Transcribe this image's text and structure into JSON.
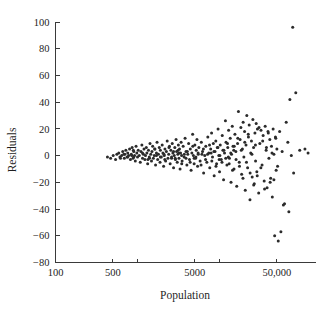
{
  "chart_data": {
    "type": "scatter",
    "title": "",
    "xlabel": "Population",
    "ylabel": "Residuals",
    "xscale": "log",
    "yscale": "linear",
    "grid": false,
    "legend": null,
    "xlim": [
      100,
      150000
    ],
    "ylim": [
      -80,
      100
    ],
    "xticks": [
      100,
      500,
      1000,
      5000,
      10000,
      50000
    ],
    "xtick_labels": [
      "100",
      "500",
      "",
      "5000",
      "",
      "50,000"
    ],
    "yticks": [
      100,
      80,
      60,
      40,
      20,
      0,
      -20,
      -40,
      -60,
      -80
    ],
    "ytick_labels": [
      "100",
      "80",
      "60",
      "40",
      "20",
      "0",
      "−20",
      "−40",
      "−60",
      "−80"
    ],
    "marker": "dot",
    "marker_color": "#2b2b2b",
    "marker_size": 1.5,
    "n_points": 281,
    "points": [
      [
        430,
        -1
      ],
      [
        470,
        -2
      ],
      [
        505,
        0
      ],
      [
        540,
        -3
      ],
      [
        560,
        1
      ],
      [
        590,
        2
      ],
      [
        610,
        -1
      ],
      [
        640,
        0
      ],
      [
        660,
        3
      ],
      [
        690,
        -2
      ],
      [
        700,
        1
      ],
      [
        720,
        4
      ],
      [
        745,
        -1
      ],
      [
        760,
        2
      ],
      [
        780,
        0
      ],
      [
        800,
        5
      ],
      [
        820,
        -3
      ],
      [
        840,
        1
      ],
      [
        860,
        6
      ],
      [
        880,
        -2
      ],
      [
        900,
        3
      ],
      [
        920,
        0
      ],
      [
        940,
        -4
      ],
      [
        960,
        7
      ],
      [
        980,
        2
      ],
      [
        1000,
        -1
      ],
      [
        1020,
        4
      ],
      [
        1050,
        0
      ],
      [
        1080,
        -5
      ],
      [
        1100,
        3
      ],
      [
        1130,
        8
      ],
      [
        1150,
        -2
      ],
      [
        1180,
        1
      ],
      [
        1200,
        5
      ],
      [
        1230,
        -3
      ],
      [
        1250,
        0
      ],
      [
        1280,
        6
      ],
      [
        1300,
        2
      ],
      [
        1330,
        -6
      ],
      [
        1360,
        4
      ],
      [
        1390,
        -1
      ],
      [
        1420,
        9
      ],
      [
        1450,
        1
      ],
      [
        1480,
        -4
      ],
      [
        1500,
        3
      ],
      [
        1530,
        7
      ],
      [
        1560,
        -2
      ],
      [
        1600,
        0
      ],
      [
        1630,
        5
      ],
      [
        1660,
        -7
      ],
      [
        1700,
        2
      ],
      [
        1730,
        10
      ],
      [
        1760,
        -3
      ],
      [
        1800,
        1
      ],
      [
        1840,
        6
      ],
      [
        1880,
        -5
      ],
      [
        1900,
        4
      ],
      [
        1950,
        -1
      ],
      [
        2000,
        8
      ],
      [
        2040,
        2
      ],
      [
        2080,
        -8
      ],
      [
        2120,
        0
      ],
      [
        2160,
        5
      ],
      [
        2200,
        -4
      ],
      [
        2250,
        3
      ],
      [
        2300,
        11
      ],
      [
        2350,
        -2
      ],
      [
        2400,
        1
      ],
      [
        2450,
        7
      ],
      [
        2500,
        -6
      ],
      [
        2550,
        4
      ],
      [
        2600,
        -1
      ],
      [
        2650,
        9
      ],
      [
        2700,
        2
      ],
      [
        2750,
        -9
      ],
      [
        2800,
        0
      ],
      [
        2850,
        6
      ],
      [
        2900,
        -3
      ],
      [
        2950,
        12
      ],
      [
        3000,
        3
      ],
      [
        3050,
        -5
      ],
      [
        3100,
        1
      ],
      [
        3150,
        8
      ],
      [
        3200,
        -2
      ],
      [
        3250,
        5
      ],
      [
        3300,
        -10
      ],
      [
        3350,
        2
      ],
      [
        3400,
        10
      ],
      [
        3450,
        0
      ],
      [
        3500,
        -4
      ],
      [
        3600,
        7
      ],
      [
        3700,
        -1
      ],
      [
        3800,
        13
      ],
      [
        3900,
        3
      ],
      [
        4000,
        -7
      ],
      [
        4100,
        1
      ],
      [
        4200,
        9
      ],
      [
        4300,
        -3
      ],
      [
        4400,
        5
      ],
      [
        4500,
        -11
      ],
      [
        4600,
        2
      ],
      [
        4700,
        16
      ],
      [
        4800,
        0
      ],
      [
        4900,
        -6
      ],
      [
        5000,
        8
      ],
      [
        5100,
        -2
      ],
      [
        5200,
        4
      ],
      [
        5300,
        12
      ],
      [
        5400,
        -8
      ],
      [
        5500,
        1
      ],
      [
        5600,
        6
      ],
      [
        5800,
        -4
      ],
      [
        6000,
        10
      ],
      [
        6200,
        3
      ],
      [
        6400,
        -13
      ],
      [
        6600,
        0
      ],
      [
        6800,
        7
      ],
      [
        7000,
        -5
      ],
      [
        7200,
        14
      ],
      [
        7400,
        2
      ],
      [
        7600,
        -9
      ],
      [
        7800,
        5
      ],
      [
        8000,
        17
      ],
      [
        8200,
        -1
      ],
      [
        8400,
        9
      ],
      [
        8600,
        -15
      ],
      [
        8800,
        3
      ],
      [
        9000,
        11
      ],
      [
        9200,
        -6
      ],
      [
        9400,
        6
      ],
      [
        9600,
        20
      ],
      [
        9800,
        0
      ],
      [
        10000,
        -12
      ],
      [
        10200,
        8
      ],
      [
        10500,
        -3
      ],
      [
        10800,
        15
      ],
      [
        11000,
        4
      ],
      [
        11200,
        -18
      ],
      [
        11500,
        2
      ],
      [
        11800,
        26
      ],
      [
        12000,
        10
      ],
      [
        12300,
        -7
      ],
      [
        12600,
        6
      ],
      [
        12900,
        19
      ],
      [
        13200,
        -2
      ],
      [
        13500,
        13
      ],
      [
        13800,
        -20
      ],
      [
        14000,
        1
      ],
      [
        14300,
        22
      ],
      [
        14600,
        7
      ],
      [
        15000,
        -10
      ],
      [
        15400,
        16
      ],
      [
        15800,
        3
      ],
      [
        16200,
        -23
      ],
      [
        16600,
        9
      ],
      [
        17000,
        33
      ],
      [
        17400,
        -5
      ],
      [
        17800,
        12
      ],
      [
        18200,
        21
      ],
      [
        18600,
        -14
      ],
      [
        19000,
        5
      ],
      [
        19400,
        25
      ],
      [
        19800,
        -1
      ],
      [
        20200,
        18
      ],
      [
        20600,
        -26
      ],
      [
        21000,
        8
      ],
      [
        21500,
        30
      ],
      [
        22000,
        -9
      ],
      [
        22500,
        14
      ],
      [
        23000,
        23
      ],
      [
        23500,
        -33
      ],
      [
        24000,
        2
      ],
      [
        24500,
        11
      ],
      [
        25000,
        -16
      ],
      [
        25500,
        27
      ],
      [
        26000,
        6
      ],
      [
        26500,
        -21
      ],
      [
        27000,
        17
      ],
      [
        27500,
        -4
      ],
      [
        28000,
        24
      ],
      [
        28500,
        -12
      ],
      [
        29000,
        20
      ],
      [
        30000,
        -28
      ],
      [
        31000,
        9
      ],
      [
        32000,
        19
      ],
      [
        33000,
        -7
      ],
      [
        34000,
        15
      ],
      [
        35000,
        -19
      ],
      [
        36000,
        22
      ],
      [
        37000,
        4
      ],
      [
        38000,
        -24
      ],
      [
        39000,
        18
      ],
      [
        40000,
        -2
      ],
      [
        41000,
        12
      ],
      [
        42000,
        -17
      ],
      [
        43000,
        7
      ],
      [
        44000,
        -31
      ],
      [
        45000,
        20
      ],
      [
        46000,
        1
      ],
      [
        47000,
        -60
      ],
      [
        48000,
        14
      ],
      [
        49000,
        -11
      ],
      [
        50000,
        5
      ],
      [
        52000,
        -64
      ],
      [
        54000,
        18
      ],
      [
        56000,
        -57
      ],
      [
        58000,
        3
      ],
      [
        60000,
        -37
      ],
      [
        62000,
        -36
      ],
      [
        65000,
        25
      ],
      [
        68000,
        10
      ],
      [
        70000,
        -42
      ],
      [
        72000,
        42
      ],
      [
        75000,
        0
      ],
      [
        78000,
        96
      ],
      [
        80000,
        -13
      ],
      [
        85000,
        47
      ],
      [
        95000,
        4
      ],
      [
        110000,
        5
      ],
      [
        120000,
        2
      ],
      [
        2150,
        -3
      ],
      [
        2420,
        6
      ],
      [
        2880,
        -2
      ],
      [
        3120,
        4
      ],
      [
        3460,
        -6
      ],
      [
        3720,
        1
      ],
      [
        4050,
        3
      ],
      [
        4380,
        -5
      ],
      [
        4720,
        7
      ],
      [
        5150,
        -1
      ],
      [
        5480,
        2
      ],
      [
        5950,
        -7
      ],
      [
        6350,
        5
      ],
      [
        6750,
        -3
      ],
      [
        7150,
        1
      ],
      [
        7550,
        8
      ],
      [
        8050,
        -4
      ],
      [
        8550,
        3
      ],
      [
        9050,
        -8
      ],
      [
        9550,
        6
      ],
      [
        10100,
        0
      ],
      [
        10700,
        -5
      ],
      [
        11300,
        4
      ],
      [
        11900,
        -2
      ],
      [
        12500,
        9
      ],
      [
        13100,
        -6
      ],
      [
        13700,
        2
      ],
      [
        14400,
        -11
      ],
      [
        15100,
        7
      ],
      [
        15900,
        -3
      ],
      [
        16700,
        13
      ],
      [
        17500,
        -8
      ],
      [
        18400,
        4
      ],
      [
        19300,
        -17
      ],
      [
        20300,
        10
      ],
      [
        21300,
        -5
      ],
      [
        22400,
        16
      ],
      [
        23600,
        -13
      ],
      [
        24800,
        1
      ],
      [
        26100,
        -22
      ],
      [
        27400,
        8
      ],
      [
        28800,
        -15
      ],
      [
        30300,
        21
      ],
      [
        31900,
        -9
      ],
      [
        33600,
        11
      ],
      [
        35400,
        -25
      ],
      [
        37300,
        6
      ],
      [
        39300,
        17
      ],
      [
        41400,
        -20
      ],
      [
        43600,
        2
      ],
      [
        46000,
        -18
      ],
      [
        48500,
        13
      ],
      [
        51000,
        -8
      ],
      [
        900,
        -1
      ],
      [
        1150,
        2
      ],
      [
        1400,
        -2
      ],
      [
        1700,
        0
      ],
      [
        2100,
        1
      ],
      [
        2600,
        -2
      ],
      [
        3200,
        2
      ],
      [
        620,
        -2
      ],
      [
        680,
        1
      ],
      [
        760,
        -1
      ],
      [
        850,
        0
      ],
      [
        1900,
        -1
      ],
      [
        4900,
        -2
      ],
      [
        7900,
        2
      ],
      [
        12800,
        -1
      ],
      [
        890,
        4
      ],
      [
        1340,
        -3
      ],
      [
        1620,
        5
      ],
      [
        2750,
        3
      ],
      [
        3900,
        -2
      ],
      [
        6100,
        1
      ],
      [
        9900,
        -3
      ],
      [
        14900,
        4
      ]
    ]
  },
  "axes": {
    "x_axis_name": "Population",
    "y_axis_name": "Residuals"
  }
}
